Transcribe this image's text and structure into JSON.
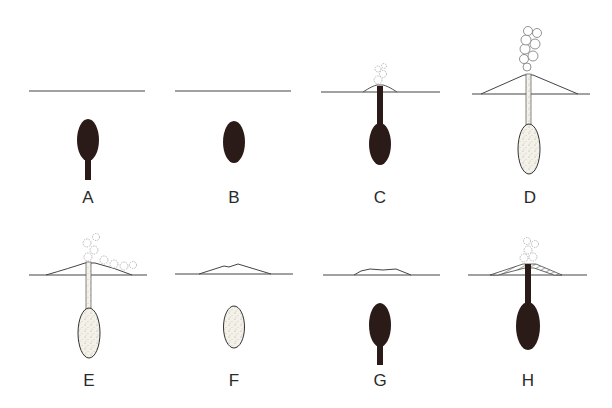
{
  "figure": {
    "colors": {
      "molten_magma": "#2a1a18",
      "solidified_magma": "#f2efe6",
      "line": "#333333",
      "steam": "#bbbbbb"
    },
    "panels": [
      {
        "label": "A",
        "surface": "flat",
        "chamber": "molten",
        "conduit": "partial",
        "plume": "none"
      },
      {
        "label": "B",
        "surface": "flat",
        "chamber": "molten",
        "conduit": "none",
        "plume": "none"
      },
      {
        "label": "C",
        "surface": "small-cone",
        "chamber": "molten",
        "conduit": "full-molten",
        "plume": "small"
      },
      {
        "label": "D",
        "surface": "large-cone",
        "chamber": "solid",
        "conduit": "full-solid",
        "plume": "tall"
      },
      {
        "label": "E",
        "surface": "medium-cone",
        "chamber": "solid",
        "conduit": "full-solid",
        "plume": "drifting"
      },
      {
        "label": "F",
        "surface": "eroded-mound",
        "chamber": "solid",
        "conduit": "none",
        "plume": "none"
      },
      {
        "label": "G",
        "surface": "low-mound",
        "chamber": "molten",
        "conduit": "partial",
        "plume": "none"
      },
      {
        "label": "H",
        "surface": "layered-cone",
        "chamber": "molten",
        "conduit": "full-molten",
        "plume": "small"
      }
    ]
  }
}
